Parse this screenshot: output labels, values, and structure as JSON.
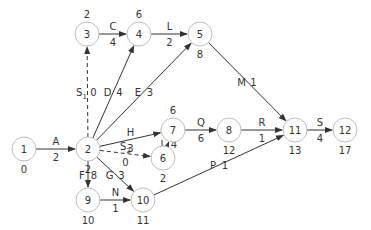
{
  "diagram": {
    "type": "activity-on-arrow network",
    "nodes": [
      {
        "id": "1",
        "x": 24,
        "y": 149,
        "time": "0",
        "time_pos": "below"
      },
      {
        "id": "2",
        "x": 88,
        "y": 149,
        "time": "2",
        "time_pos": "below"
      },
      {
        "id": "3",
        "x": 87,
        "y": 34,
        "time": "2",
        "time_pos": "above"
      },
      {
        "id": "4",
        "x": 139,
        "y": 34,
        "time": "6",
        "time_pos": "above"
      },
      {
        "id": "5",
        "x": 200,
        "y": 34,
        "time": "8",
        "time_pos": "below"
      },
      {
        "id": "6",
        "x": 163,
        "y": 158,
        "time": "2",
        "time_pos": "below"
      },
      {
        "id": "7",
        "x": 173,
        "y": 130,
        "time": "6",
        "time_pos": "above"
      },
      {
        "id": "8",
        "x": 229,
        "y": 130,
        "time": "12",
        "time_pos": "below"
      },
      {
        "id": "9",
        "x": 88,
        "y": 200,
        "time": "10",
        "time_pos": "below"
      },
      {
        "id": "10",
        "x": 143,
        "y": 200,
        "time": "11",
        "time_pos": "below"
      },
      {
        "id": "11",
        "x": 295,
        "y": 130,
        "time": "13",
        "time_pos": "below"
      },
      {
        "id": "12",
        "x": 345,
        "y": 130,
        "time": "17",
        "time_pos": "below"
      }
    ],
    "edges": [
      {
        "from": "1",
        "to": "2",
        "label": "A",
        "duration": "2",
        "dashed": false
      },
      {
        "from": "2",
        "to": "3",
        "label": "S1",
        "duration": "0",
        "dashed": true
      },
      {
        "from": "3",
        "to": "4",
        "label": "C",
        "duration": "4",
        "dashed": false
      },
      {
        "from": "2",
        "to": "4",
        "label": "D",
        "duration": "4",
        "dashed": false
      },
      {
        "from": "4",
        "to": "5",
        "label": "L",
        "duration": "2",
        "dashed": false
      },
      {
        "from": "2",
        "to": "5",
        "label": "E",
        "duration": "3",
        "dashed": false
      },
      {
        "from": "5",
        "to": "11",
        "label": "M",
        "duration": "1",
        "dashed": false
      },
      {
        "from": "2",
        "to": "7",
        "label": "H",
        "duration": "3",
        "dashed": false
      },
      {
        "from": "2",
        "to": "6",
        "label": "S2",
        "duration": "0",
        "dashed": true
      },
      {
        "from": "6",
        "to": "7",
        "label": "I",
        "duration": "4",
        "dashed": false
      },
      {
        "from": "7",
        "to": "8",
        "label": "Q",
        "duration": "6",
        "dashed": false
      },
      {
        "from": "8",
        "to": "11",
        "label": "R",
        "duration": "1",
        "dashed": false
      },
      {
        "from": "2",
        "to": "9",
        "label": "F",
        "duration": "8",
        "dashed": false
      },
      {
        "from": "2",
        "to": "10",
        "label": "G",
        "duration": "3",
        "dashed": false
      },
      {
        "from": "9",
        "to": "10",
        "label": "N",
        "duration": "1",
        "dashed": false
      },
      {
        "from": "10",
        "to": "11",
        "label": "P",
        "duration": "1",
        "dashed": false
      },
      {
        "from": "11",
        "to": "12",
        "label": "S",
        "duration": "4",
        "dashed": false
      }
    ]
  },
  "colors": {
    "node_stroke": "#bdbdbd",
    "edge": "#333333",
    "text": "#333333"
  }
}
